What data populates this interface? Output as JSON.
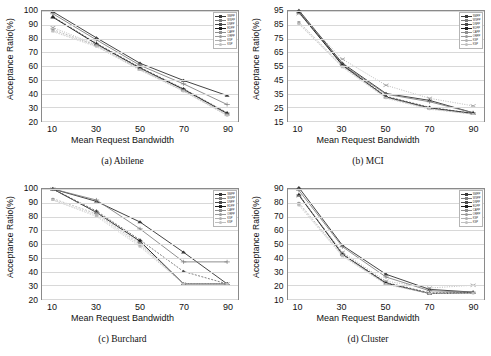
{
  "figure": {
    "xlabel": "Mean Request Bandwidth",
    "ylabel": "Acceptance Ratio(%)",
    "xticks": [
      10,
      30,
      50,
      70,
      90
    ]
  },
  "series_names": [
    "SMPP",
    "WSPP",
    "DNPP",
    "EDPP",
    "CAPP",
    "ORPP",
    "KSP",
    "KSP"
  ],
  "series_colors": [
    "#3a3a3a",
    "#7c7c7c",
    "#4b4b4b",
    "#202020",
    "#8e8e8e",
    "#9a9a9a",
    "#b0b0b0",
    "#c0c0c0"
  ],
  "panels": [
    {
      "id": "abilene",
      "caption": "(a)  Abilene",
      "yticks": [
        20,
        30,
        40,
        50,
        60,
        70,
        80,
        90,
        100
      ]
    },
    {
      "id": "mci",
      "caption": "(b)  MCI",
      "yticks": [
        15,
        25,
        35,
        45,
        55,
        65,
        75,
        85,
        95
      ]
    },
    {
      "id": "burchard",
      "caption": "(c)  Burchard",
      "yticks": [
        20,
        30,
        40,
        50,
        60,
        70,
        80,
        90,
        100
      ]
    },
    {
      "id": "cluster",
      "caption": "(d)  Cluster",
      "yticks": [
        10,
        20,
        30,
        40,
        50,
        60,
        70,
        80,
        90
      ]
    }
  ],
  "chart_data": [
    {
      "type": "line",
      "panel": "abilene",
      "title": "(a)  Abilene",
      "xlabel": "Mean Request Bandwidth",
      "ylabel": "Acceptance Ratio(%)",
      "x": [
        10,
        30,
        50,
        70,
        90
      ],
      "xlim": [
        5,
        95
      ],
      "ylim": [
        20,
        100
      ],
      "grid": true,
      "legend_position": "top-right",
      "series": [
        {
          "name": "SMPP",
          "values": [
            99.5,
            80.5,
            62.0,
            49.5,
            38.5
          ]
        },
        {
          "name": "WSPP",
          "values": [
            98.0,
            79.0,
            60.5,
            47.0,
            32.0
          ]
        },
        {
          "name": "DNPP",
          "values": [
            96.0,
            76.5,
            59.0,
            43.5,
            26.0
          ]
        },
        {
          "name": "EDPP",
          "values": [
            95.5,
            76.0,
            58.5,
            43.0,
            25.5
          ]
        },
        {
          "name": "CAPP",
          "values": [
            88.0,
            75.5,
            58.0,
            42.5,
            25.0
          ]
        },
        {
          "name": "ORPP",
          "values": [
            86.5,
            75.0,
            57.5,
            42.0,
            24.5
          ]
        },
        {
          "name": "KSP",
          "values": [
            85.5,
            74.5,
            57.0,
            42.0,
            24.0
          ]
        },
        {
          "name": "KSP",
          "values": [
            85.0,
            74.0,
            57.0,
            41.5,
            24.0
          ]
        }
      ]
    },
    {
      "type": "line",
      "panel": "mci",
      "title": "(b)  MCI",
      "xlabel": "Mean Request Bandwidth",
      "ylabel": "Acceptance Ratio(%)",
      "x": [
        10,
        30,
        50,
        70,
        90
      ],
      "xlim": [
        5,
        95
      ],
      "ylim": [
        15,
        95
      ],
      "grid": true,
      "legend_position": "top-right",
      "series": [
        {
          "name": "SMPP",
          "values": [
            95.5,
            57.0,
            35.0,
            30.0,
            21.0
          ]
        },
        {
          "name": "WSPP",
          "values": [
            95.0,
            56.0,
            34.5,
            29.0,
            21.0
          ]
        },
        {
          "name": "DNPP",
          "values": [
            94.5,
            56.0,
            33.0,
            25.0,
            20.5
          ]
        },
        {
          "name": "EDPP",
          "values": [
            94.0,
            55.5,
            32.5,
            24.5,
            20.5
          ]
        },
        {
          "name": "CAPP",
          "values": [
            93.0,
            60.0,
            41.0,
            31.5,
            26.0
          ]
        },
        {
          "name": "ORPP",
          "values": [
            87.0,
            55.0,
            32.0,
            24.0,
            20.0
          ]
        },
        {
          "name": "KSP",
          "values": [
            86.0,
            54.5,
            32.0,
            24.0,
            20.0
          ]
        },
        {
          "name": "KSP",
          "values": [
            85.5,
            54.0,
            31.5,
            23.5,
            20.0
          ]
        }
      ]
    },
    {
      "type": "line",
      "panel": "burchard",
      "title": "(c)  Burchard",
      "xlabel": "Mean Request Bandwidth",
      "ylabel": "Acceptance Ratio(%)",
      "x": [
        10,
        30,
        50,
        70,
        90
      ],
      "xlim": [
        5,
        95
      ],
      "ylim": [
        20,
        100
      ],
      "grid": true,
      "legend_position": "top-right",
      "series": [
        {
          "name": "SMPP",
          "values": [
            100.0,
            91.0,
            76.0,
            54.0,
            31.0
          ]
        },
        {
          "name": "WSPP",
          "values": [
            100.0,
            92.0,
            71.0,
            47.0,
            47.0
          ]
        },
        {
          "name": "DNPP",
          "values": [
            100.0,
            84.0,
            63.0,
            40.0,
            31.0
          ]
        },
        {
          "name": "EDPP",
          "values": [
            100.0,
            83.0,
            62.0,
            31.0,
            31.0
          ]
        },
        {
          "name": "CAPP",
          "values": [
            100.0,
            83.0,
            61.0,
            31.0,
            31.0
          ]
        },
        {
          "name": "ORPP",
          "values": [
            93.0,
            82.0,
            60.0,
            31.0,
            31.0
          ]
        },
        {
          "name": "KSP",
          "values": [
            92.0,
            81.0,
            59.0,
            31.0,
            31.0
          ]
        },
        {
          "name": "KSP",
          "values": [
            92.0,
            80.0,
            58.0,
            31.0,
            31.0
          ]
        }
      ]
    },
    {
      "type": "line",
      "panel": "cluster",
      "title": "(d)  Cluster",
      "xlabel": "Mean Request Bandwidth",
      "ylabel": "Acceptance Ratio(%)",
      "x": [
        10,
        30,
        50,
        70,
        90
      ],
      "xlim": [
        5,
        95
      ],
      "ylim": [
        10,
        90
      ],
      "grid": true,
      "legend_position": "top-right",
      "series": [
        {
          "name": "SMPP",
          "values": [
            91.0,
            49.0,
            28.0,
            17.0,
            15.0
          ]
        },
        {
          "name": "WSPP",
          "values": [
            89.0,
            48.0,
            26.0,
            16.0,
            15.0
          ]
        },
        {
          "name": "DNPP",
          "values": [
            86.0,
            43.0,
            22.0,
            14.5,
            14.5
          ]
        },
        {
          "name": "EDPP",
          "values": [
            85.5,
            42.5,
            21.5,
            14.0,
            14.5
          ]
        },
        {
          "name": "CAPP",
          "values": [
            85.0,
            44.0,
            23.0,
            18.0,
            20.0
          ]
        },
        {
          "name": "ORPP",
          "values": [
            80.0,
            42.0,
            21.0,
            14.0,
            14.5
          ]
        },
        {
          "name": "KSP",
          "values": [
            79.0,
            41.5,
            21.0,
            14.0,
            14.5
          ]
        },
        {
          "name": "KSP",
          "values": [
            78.0,
            41.0,
            20.5,
            14.0,
            14.0
          ]
        }
      ]
    }
  ]
}
